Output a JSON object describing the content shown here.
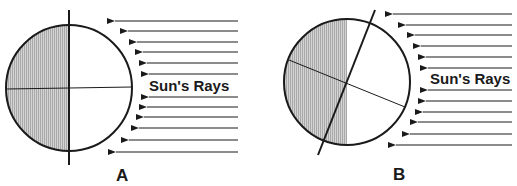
{
  "diagram": {
    "colors": {
      "ink": "#1a1a1a",
      "shade": "#c8c8c8",
      "background": "#ffffff"
    },
    "panels": [
      {
        "id": "A",
        "label": "A",
        "rays_label": "Sun's Rays",
        "axis_tilt": "vertical",
        "ray_count": 12,
        "ray_direction": "right-to-left"
      },
      {
        "id": "B",
        "label": "B",
        "rays_label": "Sun's Rays",
        "axis_tilt": "tilted",
        "ray_count": 12,
        "ray_direction": "right-to-left"
      }
    ]
  }
}
